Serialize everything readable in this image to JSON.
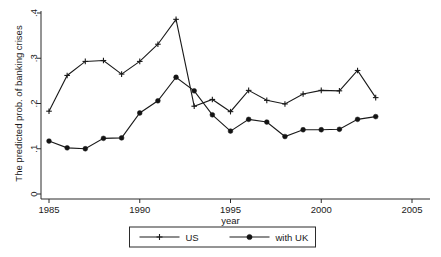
{
  "chart_data": {
    "type": "line",
    "title": "",
    "xlabel": "year",
    "ylabel": "The predicted prob. of banking crises",
    "xlim": [
      1985,
      2005
    ],
    "ylim": [
      0,
      0.4
    ],
    "grid": false,
    "legend_position": "bottom",
    "xticks": [
      "1985",
      "1990",
      "1995",
      "2000",
      "2005"
    ],
    "xtick_values": [
      1985,
      1990,
      1995,
      2000,
      2005
    ],
    "yticks": [
      "0",
      ".1",
      ".2",
      ".3",
      ".4"
    ],
    "ytick_values": [
      0,
      0.1,
      0.2,
      0.3,
      0.4
    ],
    "x": [
      1985,
      1986,
      1987,
      1988,
      1989,
      1990,
      1991,
      1992,
      1993,
      1994,
      1995,
      1996,
      1997,
      1998,
      1999,
      2000,
      2001,
      2002,
      2003
    ],
    "series": [
      {
        "name": "US",
        "marker": "plus",
        "values": [
          0.183,
          0.262,
          0.293,
          0.295,
          0.265,
          0.293,
          0.331,
          0.386,
          0.194,
          0.209,
          0.182,
          0.229,
          0.207,
          0.199,
          0.221,
          0.229,
          0.228,
          0.273,
          0.213
        ]
      },
      {
        "name": "with UK",
        "marker": "circle",
        "values": [
          0.117,
          0.102,
          0.1,
          0.123,
          0.124,
          0.179,
          0.206,
          0.258,
          0.228,
          0.175,
          0.139,
          0.165,
          0.159,
          0.127,
          0.142,
          0.142,
          0.143,
          0.165,
          0.171
        ]
      }
    ]
  },
  "legend": {
    "items": [
      {
        "label": "US"
      },
      {
        "label": "with UK"
      }
    ]
  },
  "colors": {
    "line": "#1a1a1a",
    "axis": "#2b2b2b",
    "background": "#ffffff"
  }
}
